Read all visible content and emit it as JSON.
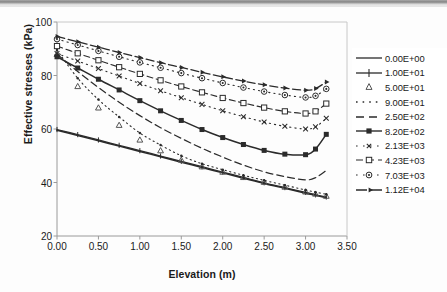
{
  "chart_data": {
    "type": "line",
    "title": "",
    "xlabel": "Elevation (m)",
    "ylabel": "Effective stresses (kPa)",
    "xlim": [
      0.0,
      3.5
    ],
    "ylim": [
      20,
      100
    ],
    "xticks": [
      "0.00",
      "0.50",
      "1.00",
      "1.50",
      "2.00",
      "2.50",
      "3.00",
      "3.50"
    ],
    "yticks": [
      "20",
      "40",
      "60",
      "80",
      "100"
    ],
    "xtick_values": [
      0.0,
      0.5,
      1.0,
      1.5,
      2.0,
      2.5,
      3.0,
      3.5
    ],
    "ytick_values": [
      20,
      40,
      60,
      80,
      100
    ],
    "grid": false,
    "legend_position": "right",
    "x": [
      0.0,
      0.25,
      0.5,
      0.75,
      1.0,
      1.25,
      1.5,
      1.75,
      2.0,
      2.25,
      2.5,
      2.75,
      3.0,
      3.12,
      3.25
    ],
    "series": [
      {
        "name": "0.00E+00",
        "style": "solid-plain",
        "values": [
          59.5,
          57.6,
          55.6,
          53.6,
          51.6,
          49.6,
          47.6,
          45.6,
          43.6,
          41.6,
          39.6,
          37.8,
          36.0,
          35.2,
          34.3
        ]
      },
      {
        "name": "1.00E+01",
        "style": "solid-tick",
        "values": [
          59.8,
          57.9,
          55.9,
          53.9,
          51.9,
          49.9,
          47.9,
          45.9,
          43.9,
          41.9,
          39.9,
          38.1,
          36.3,
          35.4,
          34.6
        ]
      },
      {
        "name": "5.00E+01",
        "style": "triangle-only",
        "values": [
          88.0,
          76.0,
          68.0,
          61.5,
          56.0,
          52.0,
          48.5,
          46.0,
          44.0,
          42.0,
          40.2,
          38.4,
          36.6,
          35.8,
          35.0
        ]
      },
      {
        "name": "9.00E+01",
        "style": "dotted-fine",
        "values": [
          89.5,
          79.0,
          71.0,
          64.5,
          58.5,
          54.0,
          50.0,
          47.0,
          44.8,
          42.7,
          40.8,
          39.0,
          37.2,
          36.4,
          35.6
        ]
      },
      {
        "name": "2.50E+02",
        "style": "dashed-long",
        "values": [
          88.0,
          81.5,
          75.5,
          70.0,
          65.0,
          60.5,
          56.5,
          52.8,
          49.5,
          46.5,
          44.0,
          42.2,
          41.0,
          41.8,
          44.5
        ]
      },
      {
        "name": "8.20E+02",
        "style": "solid-square",
        "values": [
          87.0,
          82.8,
          78.6,
          74.6,
          70.6,
          66.8,
          63.2,
          59.8,
          56.8,
          54.2,
          52.0,
          50.6,
          50.4,
          52.5,
          58.0
        ]
      },
      {
        "name": "2.13E+03",
        "style": "dotted-x",
        "values": [
          88.2,
          85.4,
          82.6,
          79.8,
          77.0,
          74.3,
          71.7,
          69.2,
          66.8,
          64.6,
          62.6,
          61.0,
          60.0,
          60.8,
          64.0
        ]
      },
      {
        "name": "4.23E+03",
        "style": "dashed-opensquare",
        "values": [
          91.0,
          88.3,
          85.7,
          83.1,
          80.6,
          78.2,
          75.9,
          73.7,
          71.6,
          69.7,
          68.0,
          66.6,
          65.8,
          66.6,
          69.5
        ]
      },
      {
        "name": "7.03E+03",
        "style": "dashdot-circle",
        "values": [
          93.6,
          91.4,
          89.2,
          87.0,
          84.9,
          82.9,
          80.9,
          79.0,
          77.2,
          75.5,
          74.0,
          72.7,
          71.8,
          72.4,
          75.0
        ]
      },
      {
        "name": "1.12E+04",
        "style": "dashed-arrow",
        "values": [
          94.6,
          92.6,
          90.6,
          88.6,
          86.7,
          84.8,
          83.0,
          81.2,
          79.5,
          77.9,
          76.5,
          75.3,
          74.5,
          75.1,
          77.6
        ]
      }
    ]
  },
  "legend": {
    "items": [
      {
        "label": "0.00E+00"
      },
      {
        "label": "1.00E+01"
      },
      {
        "label": "5.00E+01"
      },
      {
        "label": "9.00E+01"
      },
      {
        "label": "2.50E+02"
      },
      {
        "label": "8.20E+02"
      },
      {
        "label": "2.13E+03"
      },
      {
        "label": "4.23E+03"
      },
      {
        "label": "7.03E+03"
      },
      {
        "label": "1.12E+04"
      }
    ]
  },
  "colors": {
    "line": "#2b2b2b",
    "axis": "#8a8a8a",
    "text": "#1a1a1a",
    "background": "#ffffff"
  }
}
